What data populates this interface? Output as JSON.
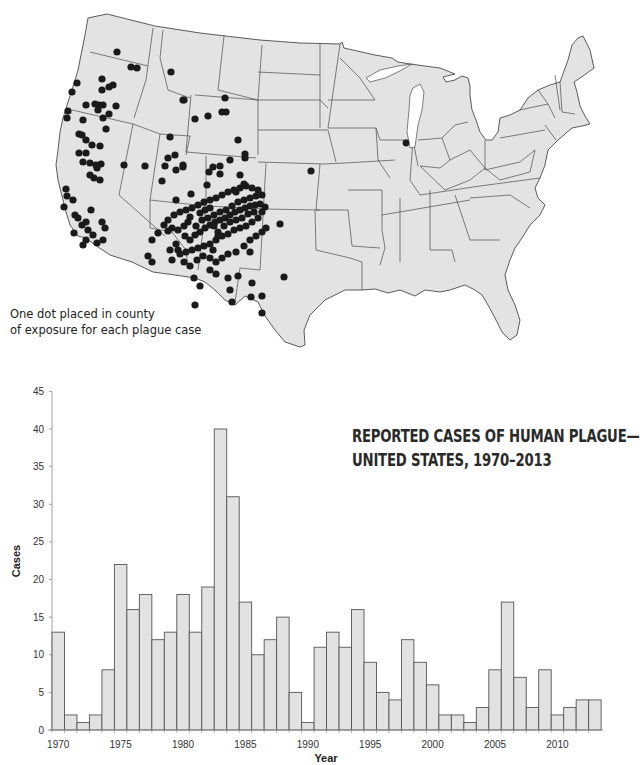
{
  "map": {
    "caption_line1": "One dot placed in county",
    "caption_line2": "of exposure for each plague case",
    "fill_color": "#e3e3e3",
    "border_color": "#4a4a4a",
    "dot_color": "#1a1a1a"
  },
  "chart": {
    "title_line1": "REPORTED CASES OF HUMAN PLAGUE—",
    "title_line2": "UNITED STATES, 1970–2013",
    "bar_fill": "#e2e2e2",
    "bar_stroke": "#555555"
  },
  "chart_data": {
    "type": "bar",
    "xlabel": "Year",
    "ylabel": "Cases",
    "ylim": [
      0,
      45
    ],
    "yticks": [
      0,
      5,
      10,
      15,
      20,
      25,
      30,
      35,
      40,
      45
    ],
    "xticks": [
      1970,
      1975,
      1980,
      1985,
      1990,
      1995,
      2000,
      2005,
      2010
    ],
    "grid": false,
    "categories": [
      1970,
      1971,
      1972,
      1973,
      1974,
      1975,
      1976,
      1977,
      1978,
      1979,
      1980,
      1981,
      1982,
      1983,
      1984,
      1985,
      1986,
      1987,
      1988,
      1989,
      1990,
      1991,
      1992,
      1993,
      1994,
      1995,
      1996,
      1997,
      1998,
      1999,
      2000,
      2001,
      2002,
      2003,
      2004,
      2005,
      2006,
      2007,
      2008,
      2009,
      2010,
      2011,
      2012,
      2013
    ],
    "values": [
      13,
      2,
      1,
      2,
      8,
      22,
      16,
      18,
      12,
      13,
      18,
      13,
      19,
      40,
      31,
      17,
      10,
      12,
      15,
      5,
      1,
      11,
      13,
      11,
      16,
      9,
      5,
      4,
      12,
      9,
      6,
      2,
      2,
      1,
      3,
      8,
      17,
      7,
      3,
      8,
      2,
      3,
      4,
      4
    ]
  }
}
